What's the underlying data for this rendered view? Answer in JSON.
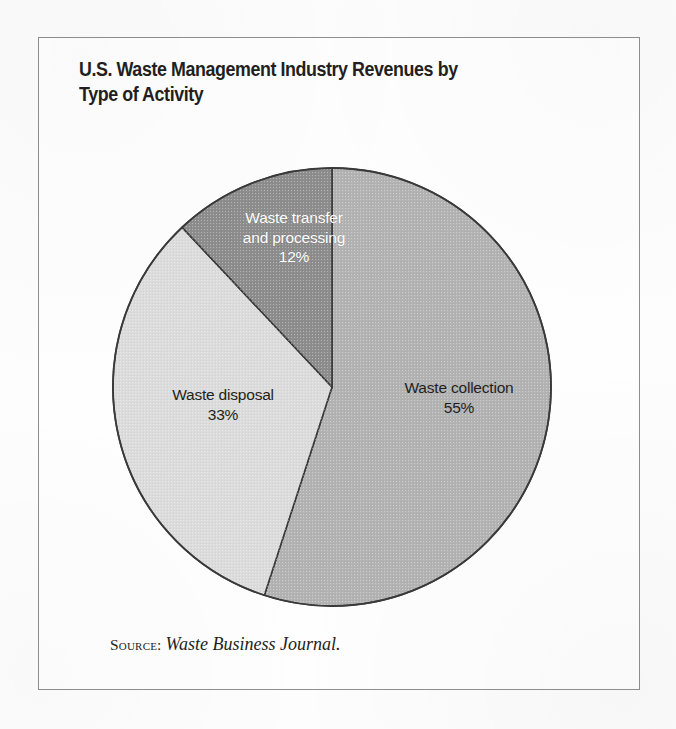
{
  "frame": {
    "border_color": "#8d8d8d",
    "background": "#fdfdfd"
  },
  "header": {
    "title": "U.S. Waste Management Industry Revenues by\nType of Activity"
  },
  "source": {
    "label": "Source:",
    "publication": "Waste Business Journal."
  },
  "chart_data": {
    "type": "pie",
    "title": "U.S. Waste Management Industry Revenues by Type of Activity",
    "subtitle": "",
    "xlabel": "",
    "ylabel": "",
    "value_unit": "percent",
    "start_angle_deg": 0,
    "direction": "clockwise",
    "legend": "none (slices labelled in place)",
    "grid": false,
    "categories": [
      "Waste collection",
      "Waste disposal",
      "Waste transfer and processing"
    ],
    "values": [
      55,
      33,
      12
    ],
    "labels": [
      "55%",
      "33%",
      "12%"
    ],
    "colors": [
      "#b3b3b3",
      "#dcdcdc",
      "#8d8d8d"
    ],
    "outline_color": "#3a3a3a",
    "slices": [
      {
        "name": "Waste collection",
        "value": 55,
        "value_label": "55%",
        "label_line1": "Waste collection",
        "label_line2": "55%",
        "color": "#b3b3b3",
        "text_color": "#231f20",
        "start_angle_deg": 0,
        "end_angle_deg": 198
      },
      {
        "name": "Waste disposal",
        "value": 33,
        "value_label": "33%",
        "label_line1": "Waste disposal",
        "label_line2": "33%",
        "color": "#dcdcdc",
        "text_color": "#231f20",
        "start_angle_deg": 198,
        "end_angle_deg": 316.8
      },
      {
        "name": "Waste transfer and processing",
        "value": 12,
        "value_label": "12%",
        "label_line1": "Waste transfer",
        "label_line2": "and processing",
        "label_line3": "12%",
        "color": "#8d8d8d",
        "text_color": "#ffffff",
        "start_angle_deg": 316.8,
        "end_angle_deg": 360
      }
    ]
  },
  "labels": {
    "collection": "Waste collection\n55%",
    "disposal": "Waste disposal\n33%",
    "transfer": "Waste transfer\nand processing\n12%"
  }
}
